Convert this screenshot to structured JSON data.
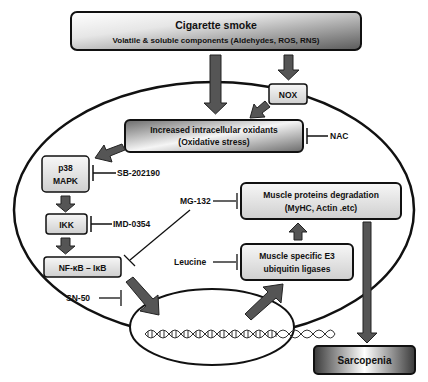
{
  "nodes": {
    "smoke": {
      "line1": "Cigarette smoke",
      "line2": "Volatile & soluble components (Aldehydes, ROS, RNS)"
    },
    "nox": {
      "label": "NOX"
    },
    "oxidants": {
      "line1": "Increased intracellular oxidants",
      "line2": "(Oxidative stress)"
    },
    "p38": {
      "line1": "p38",
      "line2": "MAPK"
    },
    "ikk": {
      "label": "IKK"
    },
    "nfkb": {
      "label": "NF-κB – IκB"
    },
    "degradation": {
      "line1": "Muscle proteins degradation",
      "line2": "(MyHC, Actin .etc)"
    },
    "e3": {
      "line1": "Muscle specific E3",
      "line2": "ubiquitin ligases"
    },
    "sarcopenia": {
      "label": "Sarcopenia"
    }
  },
  "inhibitors": {
    "nac": "NAC",
    "sb": "SB-202190",
    "imd": "IMD-0354",
    "mg132": "MG-132",
    "leucine": "Leucine",
    "sn50": "SN-50"
  },
  "colors": {
    "arrow": "#555555",
    "box_light": "#f2f2f2",
    "box_dark": "#555555",
    "outline": "#111111"
  }
}
